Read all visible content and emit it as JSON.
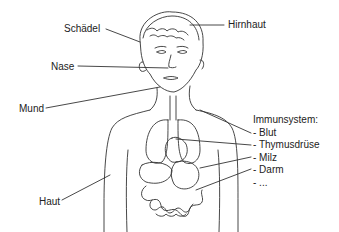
{
  "diagram": {
    "labels": {
      "schaedel": "Schädel",
      "hirnhaut": "Hirnhaut",
      "nase": "Nase",
      "mund": "Mund",
      "haut": "Haut"
    },
    "immune_system": {
      "title": "Immunsystem:",
      "items": [
        "- Blut",
        "- Thymusdrüse",
        "- Milz",
        "- Darm",
        "- ..."
      ]
    },
    "colors": {
      "line": "#333333",
      "background": "#ffffff"
    }
  }
}
